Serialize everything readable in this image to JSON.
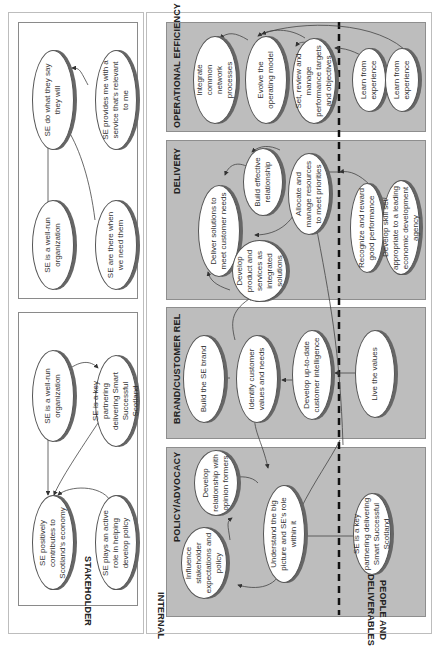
{
  "stakeholder": {
    "title": "STAKEHOLDER",
    "panel_top": {
      "nodes": [
        {
          "id": "s1",
          "label": "SE do what they say they will"
        },
        {
          "id": "s2",
          "label": "SE provides me with a service that's relevant to me"
        },
        {
          "id": "s3",
          "label": "SE is a well-run organization"
        },
        {
          "id": "s4",
          "label": "SE are there when we need them"
        }
      ]
    },
    "panel_bottom": {
      "nodes": [
        {
          "id": "s5",
          "label": "SE is a well-run organization"
        },
        {
          "id": "s6",
          "label": "SE is a key partnering delivering Smart Successful Scotland"
        },
        {
          "id": "s7",
          "label": "SE positively contributes to Scotland's economy"
        },
        {
          "id": "s8",
          "label": "SE plays an active role in helping develop policy"
        }
      ]
    }
  },
  "internal": {
    "title": "INTERNAL",
    "bands": [
      {
        "title": "OPERATIONAL EFFICIENCY"
      },
      {
        "title": "DELIVERY"
      },
      {
        "title": "BRAND/CUSTOMER REL"
      },
      {
        "title": "POLICY/ADVOCACY"
      }
    ],
    "nodes": {
      "oe1": "Integrate common network processes",
      "oe2": "Evolve the operating model",
      "oe3": "Set, review and manage performance targets and objectives",
      "d1": "Deliver solutions to meet customer needs",
      "d2": "Build effective relationship",
      "d3": "Allocate and manage resources to meet priorities",
      "d4": "Develop product and services as integrated solutions",
      "b1": "Build the SE brand",
      "b2": "Identify customer values and needs",
      "b3": "Develop up-to-date customer intelligence",
      "p1": "Develop relationship with opinion formers",
      "p2": "Influence stakeholder expectations and policy",
      "p3": "Understand the big picture and SE's role within it"
    }
  },
  "people": {
    "title_line1": "PEOPLE AND",
    "title_line2": "DELIVERABLES",
    "nodes": {
      "pe1": "Learn from experience",
      "pe2": "Learn from experience",
      "pe3": "Recognize and reward good performance",
      "pe4": "Develop skill set appropriate to a leading economic development agency",
      "pe5": "Live the values",
      "pe6": "SE is a key partnering delivering Smart Successful Scotland"
    }
  },
  "colors": {
    "band_fill": "#bdbdbd",
    "band_border": "#8e8e8e",
    "node_fill": "#ffffff",
    "node_border": "#555555",
    "dashed_line": "#111111",
    "arrow": "#444444"
  }
}
